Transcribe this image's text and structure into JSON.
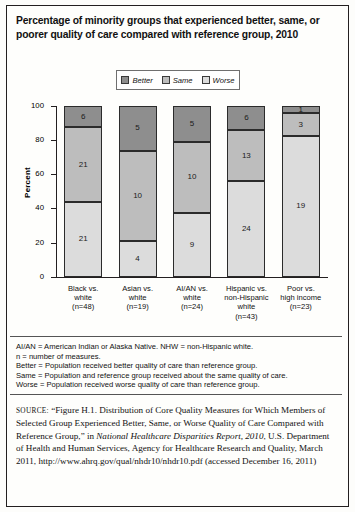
{
  "title": "Percentage of minority groups that experienced better, same, or poorer quality of care compared with reference group, 2010",
  "legend": {
    "items": [
      {
        "label": "Better",
        "color": "#8e8e8e"
      },
      {
        "label": "Same",
        "color": "#bdbdbd"
      },
      {
        "label": "Worse",
        "color": "#dcdcdc"
      }
    ]
  },
  "axis": {
    "ylabel": "Percent",
    "yticks": [
      "100",
      "80",
      "60",
      "40",
      "20",
      "0"
    ]
  },
  "xlabels": [
    {
      "l1": "Black vs.",
      "l2": "white",
      "l3": "(n=48)",
      "l4": ""
    },
    {
      "l1": "Asian vs.",
      "l2": "white",
      "l3": "(n=19)",
      "l4": ""
    },
    {
      "l1": "AI/AN vs.",
      "l2": "white",
      "l3": "(n=24)",
      "l4": ""
    },
    {
      "l1": "Hispanic vs.",
      "l2": "non-Hispanic",
      "l3": "white",
      "l4": "(n=43)"
    },
    {
      "l1": "Poor vs.",
      "l2": "high income",
      "l3": "(n=23)",
      "l4": ""
    }
  ],
  "notes": {
    "line1": "AI/AN = American Indian or Alaska Native. NHW = non-Hispanic white.",
    "line2": "n = number of measures.",
    "line3": "Better = Population received better quality of care than reference group.",
    "line4": "Same = Population and reference group received about the same quality of care.",
    "line5": "Worse = Population received worse quality of care than reference group."
  },
  "source": {
    "label": "SOURCE:",
    "text_part1": "“Figure H.1. Distribution of Core Quality Measures for Which Members of Selected Group Experienced Better, Same, or Worse Quality of Care Compared with Reference Group,” in ",
    "italic1": "National Healthcare Disparities Report, 2010",
    "text_part2": ", U.S. Department of Health and Human Services, Agency for Healthcare Research and Quality, March 2011, http://www.ahrq.gov/qual/nhdr10/nhdr10.pdf (accessed December 16, 2011)"
  },
  "chart_data": {
    "type": "bar",
    "subtype": "stacked-100-percent",
    "title": "Percentage of minority groups that experienced better, same, or poorer quality of care compared with reference group, 2010",
    "xlabel": "",
    "ylabel": "Percent",
    "ylim": [
      0,
      100
    ],
    "yticks": [
      0,
      20,
      40,
      60,
      80,
      100
    ],
    "grid": false,
    "legend_position": "top-center",
    "categories": [
      "Black vs. white (n=48)",
      "Asian vs. white (n=19)",
      "AI/AN vs. white (n=24)",
      "Hispanic vs. non-Hispanic white (n=43)",
      "Poor vs. high income (n=23)"
    ],
    "series": [
      {
        "name": "Better",
        "color": "#8e8e8e",
        "values": [
          6,
          5,
          5,
          6,
          1
        ]
      },
      {
        "name": "Same",
        "color": "#bdbdbd",
        "values": [
          21,
          10,
          10,
          13,
          3
        ]
      },
      {
        "name": "Worse",
        "color": "#dcdcdc",
        "values": [
          21,
          4,
          9,
          24,
          19
        ]
      }
    ],
    "totals": [
      48,
      19,
      24,
      43,
      23
    ],
    "note": "Segment labels show counts of measures; bar heights are normalized to 100 percent."
  },
  "bars": [
    {
      "better": 6,
      "same": 21,
      "worse": 21,
      "total": 48
    },
    {
      "better": 5,
      "same": 10,
      "worse": 4,
      "total": 19
    },
    {
      "better": 5,
      "same": 10,
      "worse": 9,
      "total": 24
    },
    {
      "better": 6,
      "same": 13,
      "worse": 24,
      "total": 43
    },
    {
      "better": 1,
      "same": 3,
      "worse": 19,
      "total": 23
    }
  ]
}
